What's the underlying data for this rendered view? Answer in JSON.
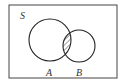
{
  "diagram": {
    "type": "venn",
    "universe_label": "S",
    "sets": [
      {
        "label": "A"
      },
      {
        "label": "B"
      }
    ],
    "shaded_region": "A ∩ B",
    "colors": {
      "stroke": "#222222",
      "background": "#ffffff",
      "hatch": "#333333"
    }
  }
}
